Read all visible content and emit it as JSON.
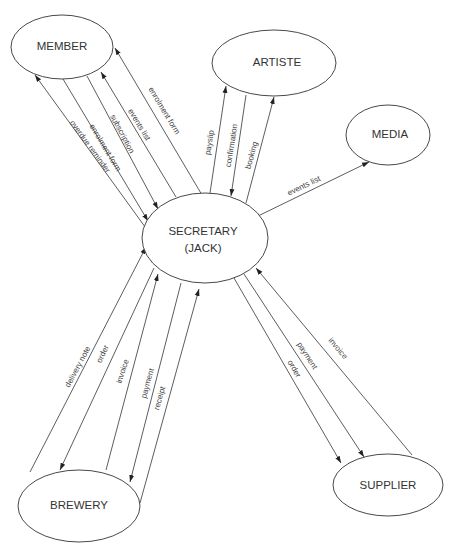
{
  "diagram": {
    "type": "context data flow diagram",
    "entities": {
      "member": {
        "label": "MEMBER",
        "cx": 62,
        "cy": 47,
        "rx": 51,
        "ry": 32
      },
      "artiste": {
        "label": "ARTISTE",
        "cx": 274,
        "cy": 63,
        "rx": 62,
        "ry": 33
      },
      "media": {
        "label": "MEDIA",
        "cx": 388,
        "cy": 135,
        "rx": 42,
        "ry": 30
      },
      "secretary": {
        "label_line1": "SECRETARY",
        "label_line2": "(JACK)",
        "cx": 205,
        "cy": 238,
        "rx": 63,
        "ry": 45
      },
      "brewery": {
        "label": "BREWERY",
        "cx": 79,
        "cy": 506,
        "rx": 61,
        "ry": 36
      },
      "supplier": {
        "label": "SUPPLIER",
        "cx": 388,
        "cy": 485,
        "rx": 55,
        "ry": 31
      }
    },
    "flows": [
      {
        "label": "overdue reminder",
        "from": "SECRETARY",
        "to": "MEMBER"
      },
      {
        "label": "enrolment form",
        "from": "MEMBER",
        "to": "SECRETARY"
      },
      {
        "label": "subscription",
        "from": "MEMBER",
        "to": "SECRETARY"
      },
      {
        "label": "events list",
        "from": "SECRETARY",
        "to": "MEMBER"
      },
      {
        "label": "enrolment form",
        "from": "SECRETARY",
        "to": "MEMBER"
      },
      {
        "label": "payslip",
        "from": "SECRETARY",
        "to": "ARTISTE"
      },
      {
        "label": "confirmation",
        "from": "ARTISTE",
        "to": "SECRETARY"
      },
      {
        "label": "booking",
        "from": "SECRETARY",
        "to": "ARTISTE"
      },
      {
        "label": "events list",
        "from": "SECRETARY",
        "to": "MEDIA"
      },
      {
        "label": "delivery note",
        "from": "BREWERY",
        "to": "SECRETARY"
      },
      {
        "label": "order",
        "from": "SECRETARY",
        "to": "BREWERY"
      },
      {
        "label": "invoice",
        "from": "BREWERY",
        "to": "SECRETARY"
      },
      {
        "label": "payment",
        "from": "SECRETARY",
        "to": "BREWERY"
      },
      {
        "label": "receipt",
        "from": "BREWERY",
        "to": "SECRETARY"
      },
      {
        "label": "order",
        "from": "SECRETARY",
        "to": "SUPPLIER"
      },
      {
        "label": "payment",
        "from": "SECRETARY",
        "to": "SUPPLIER"
      },
      {
        "label": "invoice",
        "from": "SUPPLIER",
        "to": "SECRETARY"
      }
    ]
  }
}
